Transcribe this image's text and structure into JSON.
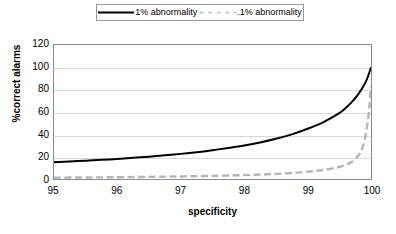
{
  "chart_data": {
    "type": "line",
    "title": "",
    "subtitle": "",
    "xlabel": "specificity",
    "ylabel": "%correct alarms",
    "xlim": [
      95,
      100
    ],
    "ylim": [
      0,
      120
    ],
    "xticks": [
      "95",
      "96",
      "97",
      "98",
      "99",
      "100"
    ],
    "yticks": [
      "0",
      "20",
      "40",
      "60",
      "80",
      "100",
      "120"
    ],
    "grid": "horizontal",
    "legend_position": "top-center",
    "series": [
      {
        "name": "1% abnormality",
        "style": "solid",
        "color": "#000000",
        "x": [
          95.0,
          95.25,
          95.5,
          95.75,
          96.0,
          96.25,
          96.5,
          96.75,
          97.0,
          97.25,
          97.5,
          97.75,
          98.0,
          98.25,
          98.5,
          98.75,
          99.0,
          99.25,
          99.5,
          99.6,
          99.7,
          99.8,
          99.9,
          99.95,
          100.0
        ],
        "values": [
          15.0,
          15.7,
          16.4,
          17.2,
          18.0,
          19.0,
          20.0,
          21.2,
          22.5,
          24.0,
          25.8,
          27.8,
          30.0,
          32.7,
          36.0,
          40.0,
          45.0,
          51.0,
          59.0,
          63.5,
          69.0,
          76.0,
          85.0,
          91.5,
          100.0
        ]
      },
      {
        "name": ".1% abnormality",
        "style": "dashed",
        "color": "#b5b5b5",
        "x": [
          95.0,
          95.5,
          96.0,
          96.5,
          97.0,
          97.5,
          98.0,
          98.25,
          98.5,
          98.75,
          99.0,
          99.2,
          99.4,
          99.5,
          99.6,
          99.7,
          99.8,
          99.85,
          99.9,
          99.95,
          99.98,
          100.0
        ],
        "values": [
          1.2,
          1.4,
          1.6,
          1.9,
          2.3,
          2.8,
          3.5,
          4.0,
          4.6,
          5.4,
          6.5,
          7.7,
          9.5,
          10.8,
          12.6,
          15.5,
          21.0,
          26.0,
          35.0,
          52.0,
          68.0,
          83.0
        ]
      }
    ]
  },
  "legend": {
    "entries": [
      {
        "label": "1% abnormality",
        "swatch": "solid-black-line"
      },
      {
        "label": ".1% abnormality",
        "swatch": "dashed-gray-line"
      }
    ]
  },
  "axes": {
    "x": {
      "label": "specificity",
      "ticks": [
        "95",
        "96",
        "97",
        "98",
        "99",
        "100"
      ]
    },
    "y": {
      "label": "%correct alarms",
      "ticks": [
        "0",
        "20",
        "40",
        "60",
        "80",
        "100",
        "120"
      ]
    }
  },
  "colors": {
    "series_primary": "#000000",
    "series_secondary": "#b5b5b5",
    "gridline": "#d9d9d9",
    "frame": "#8c8c8c",
    "background": "#ffffff"
  }
}
